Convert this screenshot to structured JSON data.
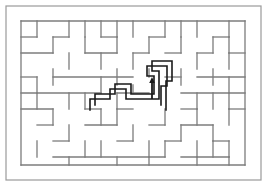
{
  "figure": {
    "background_color": "#ffffff",
    "width": 267,
    "height": 186
  },
  "frame": {
    "name": "outer-border",
    "x": 6,
    "y": 6,
    "width": 255,
    "height": 174,
    "stroke_color": "#9a9a9a",
    "stroke_width": 1.2
  },
  "maze": {
    "origin_x": 21,
    "origin_y": 21,
    "cell_width": 16,
    "cell_height": 16,
    "columns": 14,
    "rows": 9,
    "wall_color": "#7c7c7c",
    "wall_width": 1.3,
    "border_color": "#7c7c7c",
    "border_width": 1.3,
    "border_segments": [
      {
        "x1": 21,
        "y1": 21,
        "x2": 245,
        "y2": 21
      },
      {
        "x1": 21,
        "y1": 165,
        "x2": 245,
        "y2": 165
      },
      {
        "x1": 21,
        "y1": 21,
        "x2": 21,
        "y2": 165
      },
      {
        "x1": 245,
        "y1": 21,
        "x2": 245,
        "y2": 165
      }
    ],
    "interior_walls": [
      {
        "x1": 37,
        "y1": 21,
        "x2": 37,
        "y2": 37
      },
      {
        "x1": 69,
        "y1": 21,
        "x2": 69,
        "y2": 37
      },
      {
        "x1": 85,
        "y1": 21,
        "x2": 85,
        "y2": 37
      },
      {
        "x1": 101,
        "y1": 21,
        "x2": 101,
        "y2": 37
      },
      {
        "x1": 117,
        "y1": 21,
        "x2": 117,
        "y2": 37
      },
      {
        "x1": 133,
        "y1": 21,
        "x2": 133,
        "y2": 37
      },
      {
        "x1": 165,
        "y1": 21,
        "x2": 165,
        "y2": 37
      },
      {
        "x1": 181,
        "y1": 21,
        "x2": 181,
        "y2": 37
      },
      {
        "x1": 197,
        "y1": 21,
        "x2": 197,
        "y2": 37
      },
      {
        "x1": 229,
        "y1": 21,
        "x2": 229,
        "y2": 37
      },
      {
        "x1": 21,
        "y1": 37,
        "x2": 37,
        "y2": 37
      },
      {
        "x1": 53,
        "y1": 37,
        "x2": 69,
        "y2": 37
      },
      {
        "x1": 101,
        "y1": 37,
        "x2": 117,
        "y2": 37
      },
      {
        "x1": 149,
        "y1": 37,
        "x2": 165,
        "y2": 37
      },
      {
        "x1": 213,
        "y1": 37,
        "x2": 229,
        "y2": 37
      },
      {
        "x1": 53,
        "y1": 37,
        "x2": 53,
        "y2": 53
      },
      {
        "x1": 85,
        "y1": 37,
        "x2": 85,
        "y2": 53
      },
      {
        "x1": 117,
        "y1": 37,
        "x2": 117,
        "y2": 53
      },
      {
        "x1": 149,
        "y1": 37,
        "x2": 149,
        "y2": 53
      },
      {
        "x1": 181,
        "y1": 37,
        "x2": 181,
        "y2": 53
      },
      {
        "x1": 213,
        "y1": 37,
        "x2": 213,
        "y2": 53
      },
      {
        "x1": 229,
        "y1": 37,
        "x2": 229,
        "y2": 53
      },
      {
        "x1": 21,
        "y1": 53,
        "x2": 53,
        "y2": 53
      },
      {
        "x1": 85,
        "y1": 53,
        "x2": 117,
        "y2": 53
      },
      {
        "x1": 133,
        "y1": 53,
        "x2": 149,
        "y2": 53
      },
      {
        "x1": 165,
        "y1": 53,
        "x2": 181,
        "y2": 53
      },
      {
        "x1": 197,
        "y1": 53,
        "x2": 213,
        "y2": 53
      },
      {
        "x1": 229,
        "y1": 53,
        "x2": 245,
        "y2": 53
      },
      {
        "x1": 69,
        "y1": 53,
        "x2": 69,
        "y2": 69
      },
      {
        "x1": 101,
        "y1": 53,
        "x2": 101,
        "y2": 69
      },
      {
        "x1": 133,
        "y1": 53,
        "x2": 133,
        "y2": 69
      },
      {
        "x1": 197,
        "y1": 53,
        "x2": 197,
        "y2": 69
      },
      {
        "x1": 229,
        "y1": 53,
        "x2": 229,
        "y2": 69
      },
      {
        "x1": 53,
        "y1": 69,
        "x2": 53,
        "y2": 85
      },
      {
        "x1": 117,
        "y1": 69,
        "x2": 117,
        "y2": 85
      },
      {
        "x1": 149,
        "y1": 69,
        "x2": 149,
        "y2": 77
      },
      {
        "x1": 181,
        "y1": 69,
        "x2": 181,
        "y2": 85
      },
      {
        "x1": 213,
        "y1": 69,
        "x2": 213,
        "y2": 85
      },
      {
        "x1": 21,
        "y1": 77,
        "x2": 37,
        "y2": 77
      },
      {
        "x1": 53,
        "y1": 77,
        "x2": 133,
        "y2": 77
      },
      {
        "x1": 165,
        "y1": 77,
        "x2": 181,
        "y2": 77
      },
      {
        "x1": 197,
        "y1": 77,
        "x2": 245,
        "y2": 77
      },
      {
        "x1": 37,
        "y1": 77,
        "x2": 37,
        "y2": 93
      },
      {
        "x1": 101,
        "y1": 77,
        "x2": 101,
        "y2": 93
      },
      {
        "x1": 133,
        "y1": 85,
        "x2": 133,
        "y2": 93
      },
      {
        "x1": 229,
        "y1": 77,
        "x2": 229,
        "y2": 93
      },
      {
        "x1": 21,
        "y1": 93,
        "x2": 101,
        "y2": 93
      },
      {
        "x1": 117,
        "y1": 93,
        "x2": 149,
        "y2": 93
      },
      {
        "x1": 181,
        "y1": 93,
        "x2": 245,
        "y2": 93
      },
      {
        "x1": 37,
        "y1": 93,
        "x2": 37,
        "y2": 109
      },
      {
        "x1": 69,
        "y1": 93,
        "x2": 69,
        "y2": 109
      },
      {
        "x1": 85,
        "y1": 93,
        "x2": 85,
        "y2": 109
      },
      {
        "x1": 117,
        "y1": 93,
        "x2": 117,
        "y2": 109
      },
      {
        "x1": 197,
        "y1": 93,
        "x2": 197,
        "y2": 109
      },
      {
        "x1": 213,
        "y1": 93,
        "x2": 213,
        "y2": 109
      },
      {
        "x1": 229,
        "y1": 93,
        "x2": 229,
        "y2": 109
      },
      {
        "x1": 21,
        "y1": 109,
        "x2": 53,
        "y2": 109
      },
      {
        "x1": 85,
        "y1": 109,
        "x2": 101,
        "y2": 109
      },
      {
        "x1": 117,
        "y1": 109,
        "x2": 133,
        "y2": 109
      },
      {
        "x1": 181,
        "y1": 109,
        "x2": 197,
        "y2": 109
      },
      {
        "x1": 229,
        "y1": 109,
        "x2": 245,
        "y2": 109
      },
      {
        "x1": 53,
        "y1": 109,
        "x2": 53,
        "y2": 125
      },
      {
        "x1": 101,
        "y1": 109,
        "x2": 101,
        "y2": 125
      },
      {
        "x1": 117,
        "y1": 109,
        "x2": 117,
        "y2": 125
      },
      {
        "x1": 165,
        "y1": 109,
        "x2": 165,
        "y2": 125
      },
      {
        "x1": 197,
        "y1": 109,
        "x2": 197,
        "y2": 125
      },
      {
        "x1": 229,
        "y1": 109,
        "x2": 229,
        "y2": 125
      },
      {
        "x1": 69,
        "y1": 125,
        "x2": 69,
        "y2": 141
      },
      {
        "x1": 133,
        "y1": 125,
        "x2": 133,
        "y2": 141
      },
      {
        "x1": 181,
        "y1": 125,
        "x2": 181,
        "y2": 141
      },
      {
        "x1": 213,
        "y1": 125,
        "x2": 213,
        "y2": 141
      },
      {
        "x1": 37,
        "y1": 125,
        "x2": 53,
        "y2": 125
      },
      {
        "x1": 85,
        "y1": 125,
        "x2": 117,
        "y2": 125
      },
      {
        "x1": 149,
        "y1": 125,
        "x2": 165,
        "y2": 125
      },
      {
        "x1": 181,
        "y1": 125,
        "x2": 213,
        "y2": 125
      },
      {
        "x1": 37,
        "y1": 141,
        "x2": 37,
        "y2": 157
      },
      {
        "x1": 85,
        "y1": 141,
        "x2": 85,
        "y2": 157
      },
      {
        "x1": 101,
        "y1": 141,
        "x2": 101,
        "y2": 157
      },
      {
        "x1": 149,
        "y1": 141,
        "x2": 149,
        "y2": 157
      },
      {
        "x1": 165,
        "y1": 141,
        "x2": 165,
        "y2": 157
      },
      {
        "x1": 197,
        "y1": 141,
        "x2": 197,
        "y2": 157
      },
      {
        "x1": 213,
        "y1": 141,
        "x2": 213,
        "y2": 157
      },
      {
        "x1": 229,
        "y1": 141,
        "x2": 229,
        "y2": 157
      },
      {
        "x1": 53,
        "y1": 141,
        "x2": 69,
        "y2": 141
      },
      {
        "x1": 117,
        "y1": 141,
        "x2": 133,
        "y2": 141
      },
      {
        "x1": 165,
        "y1": 141,
        "x2": 181,
        "y2": 141
      },
      {
        "x1": 213,
        "y1": 141,
        "x2": 229,
        "y2": 141
      },
      {
        "x1": 53,
        "y1": 157,
        "x2": 165,
        "y2": 157
      },
      {
        "x1": 181,
        "y1": 157,
        "x2": 229,
        "y2": 157
      },
      {
        "x1": 69,
        "y1": 157,
        "x2": 69,
        "y2": 165
      },
      {
        "x1": 117,
        "y1": 157,
        "x2": 117,
        "y2": 165
      },
      {
        "x1": 149,
        "y1": 157,
        "x2": 149,
        "y2": 165
      },
      {
        "x1": 197,
        "y1": 157,
        "x2": 197,
        "y2": 165
      },
      {
        "x1": 229,
        "y1": 157,
        "x2": 229,
        "y2": 165
      }
    ]
  },
  "solution": {
    "name": "solution-corridor",
    "stroke_color": "#1a1a1a",
    "stroke_width": 1.6,
    "outline_points": "90,110 90,99 110,99 110,89 126,89 126,99 159,99 159,71 152,71 152,61 172,61 172,81 166,81 166,95 166,110",
    "description": "Bold traced corridor outline of the maze solution",
    "arrow": {
      "name": "direction-arrow",
      "x": 152,
      "y": 88,
      "direction": "up",
      "tail_y": 99,
      "head_y": 77,
      "color": "#1a1a1a"
    }
  }
}
